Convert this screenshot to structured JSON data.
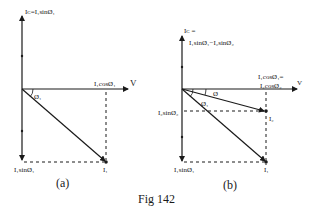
{
  "figure": {
    "caption": "Fig 142",
    "panels": [
      {
        "id": "a",
        "label": "(a)",
        "y_axis_label": "Iᴄ=I₁sinØ₁",
        "x_axis_end_label": "V",
        "x_projection_label": "I₁cosØ₁",
        "angle_label": "Ø₁",
        "y_projection_label": "I₁sinØ₁",
        "phasor_label": "I₁"
      },
      {
        "id": "b",
        "label": "(b)",
        "y_axis_label_line1": "Iᴄ =",
        "y_axis_label_line2": "I₁sinØ₁−I₂sinØ₂",
        "x_axis_end_label": "V",
        "x_projection_label_line1": "I₁cosØ₁=",
        "x_projection_label_line2": "I₂cosØ₂",
        "angle_label_phi": "Ø",
        "angle_label_phi1": "Ø₁",
        "y_projection_label_2": "I₂sinØ₂",
        "y_projection_label_1": "I₁sinØ₁",
        "phasor_label_2": "I₂",
        "phasor_label_1": "I₁"
      }
    ],
    "colors": {
      "line": "#1a1a1a",
      "background": "#ffffff"
    }
  }
}
